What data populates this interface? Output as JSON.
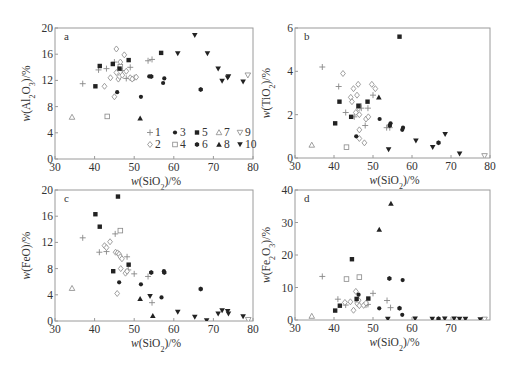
{
  "figure": {
    "legend": [
      {
        "id": "1",
        "symbol": "plus",
        "color": "#888888"
      },
      {
        "id": "2",
        "symbol": "diamond-open",
        "color": "#888888"
      },
      {
        "id": "3",
        "symbol": "circle-filled",
        "color": "#222222"
      },
      {
        "id": "4",
        "symbol": "square-open",
        "color": "#888888"
      },
      {
        "id": "5",
        "symbol": "square-filled",
        "color": "#222222"
      },
      {
        "id": "6",
        "symbol": "hexagon-filled",
        "color": "#222222"
      },
      {
        "id": "7",
        "symbol": "triangle-up-open",
        "color": "#888888"
      },
      {
        "id": "8",
        "symbol": "triangle-up-filled",
        "color": "#222222"
      },
      {
        "id": "9",
        "symbol": "triangle-down-open",
        "color": "#888888"
      },
      {
        "id": "10",
        "symbol": "triangle-down-filled",
        "color": "#222222"
      }
    ]
  },
  "chart_data": [
    {
      "type": "scatter",
      "panel": "a",
      "xlabel": "w(SiO2)/%",
      "ylabel": "w(Al2O3)/%",
      "xlim": [
        30,
        80
      ],
      "ylim": [
        0,
        20
      ],
      "xticks": [
        30,
        40,
        50,
        60,
        70,
        80
      ],
      "yticks": [
        0,
        4,
        8,
        12,
        16,
        20
      ],
      "grid": false,
      "legend_position": "lower right",
      "box": {
        "x0": 55,
        "x1": 253,
        "y0": 28,
        "y1": 159
      },
      "series": [
        {
          "name": "1",
          "points": [
            [
              37,
              11.5
            ],
            [
              41,
              13.6
            ],
            [
              43,
              13.8
            ],
            [
              45,
              14.8
            ],
            [
              47,
              13.5
            ],
            [
              48,
              12.3
            ],
            [
              49,
              14.0
            ],
            [
              50,
              12.4
            ],
            [
              53.5,
              15.0
            ],
            [
              54.5,
              15.2
            ]
          ]
        },
        {
          "name": "2",
          "points": [
            [
              42.5,
              11.1
            ],
            [
              44,
              12.4
            ],
            [
              45,
              9.5
            ],
            [
              45.5,
              16.8
            ],
            [
              45.5,
              13.2
            ],
            [
              46,
              12.2
            ],
            [
              46.3,
              12.6
            ],
            [
              46.5,
              14.8
            ],
            [
              47,
              12.8
            ],
            [
              47.5,
              15.9
            ],
            [
              48,
              13.4
            ],
            [
              49,
              12.4
            ],
            [
              49.5,
              12.2
            ],
            [
              50.5,
              12.5
            ]
          ]
        },
        {
          "name": "3",
          "points": [
            [
              45.7,
              10.2
            ],
            [
              51.7,
              9.5
            ],
            [
              53.8,
              12.6
            ],
            [
              57.3,
              11.6
            ],
            [
              57.6,
              12.3
            ]
          ]
        },
        {
          "name": "4",
          "points": [
            [
              43.2,
              6.5
            ],
            [
              46.5,
              14.1
            ]
          ]
        },
        {
          "name": "5",
          "points": [
            [
              40.2,
              11.1
            ],
            [
              41.3,
              14.2
            ],
            [
              44.6,
              14.5
            ],
            [
              46.3,
              13.8
            ],
            [
              48.6,
              15.1
            ],
            [
              56.8,
              16.2
            ]
          ]
        },
        {
          "name": "6",
          "points": [
            [
              54.3,
              12.6
            ],
            [
              66.8,
              10.6
            ]
          ]
        },
        {
          "name": "7",
          "points": [
            [
              34.3,
              6.4
            ]
          ]
        },
        {
          "name": "8",
          "points": [
            [
              51.5,
              6.2
            ]
          ]
        },
        {
          "name": "9",
          "points": [
            [
              78.7,
              12.8
            ]
          ]
        },
        {
          "name": "10",
          "points": [
            [
              61,
              16.1
            ],
            [
              65.3,
              18.9
            ],
            [
              68.5,
              16.1
            ],
            [
              71.2,
              13.8
            ],
            [
              72.2,
              11.9
            ],
            [
              73.6,
              12.4
            ],
            [
              73.8,
              12.6
            ],
            [
              77.5,
              11.8
            ]
          ]
        }
      ]
    },
    {
      "type": "scatter",
      "panel": "b",
      "xlabel": "w(SiO2)/%",
      "ylabel": "w(TiO2)/%",
      "xlim": [
        30,
        80
      ],
      "ylim": [
        0,
        6
      ],
      "xticks": [
        30,
        40,
        50,
        60,
        70,
        80
      ],
      "yticks": [
        0,
        2,
        4,
        6
      ],
      "grid": false,
      "box": {
        "x0": 295,
        "x1": 490,
        "y0": 28,
        "y1": 158
      },
      "series": [
        {
          "name": "1",
          "points": [
            [
              37,
              4.2
            ],
            [
              41.2,
              3.3
            ],
            [
              43,
              2.1
            ],
            [
              45.2,
              1.9
            ],
            [
              47,
              2.3
            ],
            [
              48,
              1.5
            ],
            [
              48.7,
              2.3
            ],
            [
              50,
              2.9
            ],
            [
              53.5,
              1.4
            ],
            [
              54.3,
              1.4
            ]
          ]
        },
        {
          "name": "2",
          "points": [
            [
              42.3,
              3.9
            ],
            [
              44.3,
              2.8
            ],
            [
              44.6,
              2.6
            ],
            [
              45,
              3.2
            ],
            [
              45.6,
              2.1
            ],
            [
              45.9,
              2.9
            ],
            [
              46.2,
              3.4
            ],
            [
              46.3,
              2.3
            ],
            [
              46.5,
              2.0
            ],
            [
              46.5,
              1.3
            ],
            [
              46.5,
              0.9
            ],
            [
              47.8,
              0.7
            ],
            [
              48.2,
              1.8
            ],
            [
              48.8,
              1.9
            ],
            [
              49.7,
              3.4
            ],
            [
              50.6,
              3.2
            ]
          ]
        },
        {
          "name": "3",
          "points": [
            [
              45.7,
              1.0
            ],
            [
              51.7,
              1.8
            ],
            [
              54.5,
              1.6
            ],
            [
              57.5,
              1.3
            ],
            [
              57.7,
              1.4
            ]
          ]
        },
        {
          "name": "4",
          "points": [
            [
              43.2,
              0.5
            ],
            [
              46.4,
              2.4
            ]
          ]
        },
        {
          "name": "5",
          "points": [
            [
              40.3,
              1.6
            ],
            [
              41.4,
              2.6
            ],
            [
              44.4,
              1.9
            ],
            [
              46.3,
              2.4
            ],
            [
              48.6,
              2.6
            ],
            [
              56.8,
              5.6
            ]
          ]
        },
        {
          "name": "6",
          "points": [
            [
              54.3,
              1.5
            ],
            [
              66.8,
              0.7
            ]
          ]
        },
        {
          "name": "7",
          "points": [
            [
              34.3,
              0.6
            ]
          ]
        },
        {
          "name": "8",
          "points": [
            [
              51.5,
              2.8
            ]
          ]
        },
        {
          "name": "9",
          "points": [
            [
              78.6,
              0.1
            ]
          ]
        },
        {
          "name": "10",
          "points": [
            [
              54,
              0.4
            ],
            [
              61,
              0.8
            ],
            [
              65.3,
              0.5
            ],
            [
              68.5,
              1.1
            ],
            [
              72.2,
              0.2
            ]
          ]
        }
      ]
    },
    {
      "type": "scatter",
      "panel": "c",
      "xlabel": "w(SiO2)/%",
      "ylabel": "w(FeO)/%",
      "xlim": [
        30,
        80
      ],
      "ylim": [
        0,
        20
      ],
      "xticks": [
        30,
        40,
        50,
        60,
        70,
        80
      ],
      "yticks": [
        0,
        4,
        8,
        12,
        16,
        20
      ],
      "grid": false,
      "box": {
        "x0": 55,
        "x1": 253,
        "y0": 190,
        "y1": 321
      },
      "series": [
        {
          "name": "1",
          "points": [
            [
              37,
              12.7
            ],
            [
              41.2,
              10.5
            ],
            [
              43,
              10.6
            ],
            [
              45.2,
              13.3
            ],
            [
              48.2,
              9.8
            ],
            [
              48.5,
              7.8
            ],
            [
              50,
              7.2
            ],
            [
              53.5,
              6.8
            ],
            [
              54.5,
              2.8
            ]
          ]
        },
        {
          "name": "2",
          "points": [
            [
              42.5,
              11.5
            ],
            [
              43,
              11.2
            ],
            [
              43.9,
              12.1
            ],
            [
              45.3,
              10.5
            ],
            [
              45.7,
              4.2
            ],
            [
              45.8,
              10.4
            ],
            [
              46.2,
              10.2
            ],
            [
              46.5,
              9.8
            ],
            [
              46.6,
              8.0
            ],
            [
              46.9,
              9.5
            ],
            [
              47.8,
              7.3
            ],
            [
              48.2,
              7.6
            ]
          ]
        },
        {
          "name": "3",
          "points": [
            [
              46.2,
              5.9
            ],
            [
              51.7,
              5.6
            ],
            [
              56.9,
              3.6
            ],
            [
              57.5,
              7.6
            ]
          ]
        },
        {
          "name": "4",
          "points": [
            [
              46.5,
              13.8
            ]
          ]
        },
        {
          "name": "5",
          "points": [
            [
              40.2,
              16.3
            ],
            [
              41.3,
              14.4
            ],
            [
              44.7,
              7.6
            ],
            [
              45.9,
              19.0
            ],
            [
              48.6,
              8.6
            ]
          ]
        },
        {
          "name": "6",
          "points": [
            [
              54.3,
              7.4
            ],
            [
              57.6,
              7.4
            ],
            [
              66.8,
              4.9
            ]
          ]
        },
        {
          "name": "7",
          "points": [
            [
              34.3,
              5.0
            ]
          ]
        },
        {
          "name": "8",
          "points": [
            [
              51.5,
              3.4
            ],
            [
              54.7,
              0.8
            ]
          ]
        },
        {
          "name": "9",
          "points": [
            [
              78.8,
              0.2
            ]
          ]
        },
        {
          "name": "10",
          "points": [
            [
              54,
              3.8
            ],
            [
              61,
              1.4
            ],
            [
              65.3,
              0.6
            ],
            [
              68.3,
              0.1
            ],
            [
              71.2,
              1.1
            ],
            [
              72.2,
              1.6
            ],
            [
              73.6,
              1.5
            ],
            [
              73.8,
              1.1
            ],
            [
              77.5,
              0.7
            ]
          ]
        }
      ]
    },
    {
      "type": "scatter",
      "panel": "d",
      "xlabel": "w(SiO2)/%",
      "ylabel": "w(Fe2O3)/%",
      "xlim": [
        30,
        80
      ],
      "ylim": [
        0,
        40
      ],
      "xticks": [
        30,
        40,
        50,
        60,
        70
      ],
      "yticks": [
        0,
        10,
        20,
        30,
        40
      ],
      "grid": false,
      "box": {
        "x0": 295,
        "x1": 490,
        "y0": 190,
        "y1": 320
      },
      "series": [
        {
          "name": "1",
          "points": [
            [
              37,
              13.4
            ],
            [
              41,
              6.4
            ],
            [
              43,
              4.6
            ],
            [
              46,
              5.6
            ],
            [
              48.2,
              4.6
            ],
            [
              48.7,
              4.8
            ],
            [
              50,
              8.2
            ],
            [
              53.6,
              6.0
            ],
            [
              54.5,
              3.8
            ]
          ]
        },
        {
          "name": "2",
          "points": [
            [
              42.8,
              5.4
            ],
            [
              44.2,
              5.6
            ],
            [
              45,
              3.0
            ],
            [
              45.6,
              8.8
            ],
            [
              46,
              5.0
            ],
            [
              46.3,
              6.1
            ],
            [
              46.5,
              4.4
            ],
            [
              47.6,
              4.5
            ],
            [
              48.2,
              5.2
            ]
          ]
        },
        {
          "name": "3",
          "points": [
            [
              46.3,
              7.8
            ],
            [
              51.6,
              3.6
            ],
            [
              57.5,
              1.6
            ],
            [
              57.6,
              12.3
            ]
          ]
        },
        {
          "name": "4",
          "points": [
            [
              43.2,
              12.6
            ],
            [
              46.5,
              13.2
            ]
          ]
        },
        {
          "name": "5",
          "points": [
            [
              40.3,
              2.9
            ],
            [
              41.5,
              4.4
            ],
            [
              44.6,
              18.7
            ],
            [
              45.8,
              6.5
            ],
            [
              48.8,
              6.6
            ]
          ]
        },
        {
          "name": "6",
          "points": [
            [
              54.2,
              12.8
            ],
            [
              56.8,
              3.6
            ],
            [
              66.8,
              0.4
            ]
          ]
        },
        {
          "name": "7",
          "points": [
            [
              34.3,
              1.2
            ]
          ]
        },
        {
          "name": "8",
          "points": [
            [
              51.6,
              27.8
            ],
            [
              54.6,
              35.8
            ]
          ]
        },
        {
          "name": "9",
          "points": [
            [
              78.6,
              0.2
            ]
          ]
        },
        {
          "name": "10",
          "points": [
            [
              53.8,
              0.3
            ],
            [
              60.8,
              0.4
            ],
            [
              65.2,
              0.3
            ],
            [
              68.4,
              0.4
            ],
            [
              70.8,
              0.4
            ],
            [
              72.2,
              0.3
            ],
            [
              73.7,
              0.3
            ],
            [
              77.5,
              0.2
            ]
          ]
        }
      ]
    }
  ]
}
